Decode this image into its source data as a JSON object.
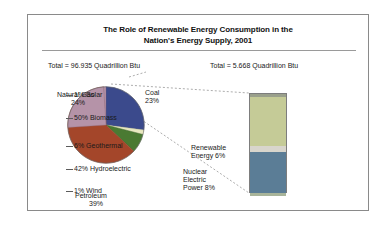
{
  "figure": {
    "title_line1": "The Role of Renewable Energy Consumption in the",
    "title_line2": "Nation's Energy Supply, 2001",
    "total_left": "Total = 96.935 Quadrillion Btu",
    "total_right": "Total = 5.668 Quadrillion Btu"
  },
  "chart_data": [
    {
      "type": "pie",
      "title": "Nation's Energy Supply, 2001",
      "total_label": "Total = 96.935 Quadrillion Btu",
      "total_value": 96.935,
      "units": "Quadrillion Btu",
      "categories": [
        "Coal",
        "Renewable Energy",
        "Nuclear Electric Power",
        "Petroleum",
        "Natural Gas"
      ],
      "values": [
        23,
        6,
        8,
        39,
        24
      ],
      "colors": [
        "#3b4a8c",
        "#e8e8c0",
        "#4a7a32",
        "#a4462a",
        "#b593a8"
      ],
      "labels": [
        {
          "name": "Coal",
          "pct": "23%",
          "value": 23
        },
        {
          "name": "Renewable Energy",
          "pct": "6%",
          "value": 6
        },
        {
          "name": "Nuclear Electric Power",
          "pct": "8%",
          "value": 8
        },
        {
          "name": "Petroleum",
          "pct": "39%",
          "value": 39
        },
        {
          "name": "Natural Gas",
          "pct": "24%",
          "value": 24
        }
      ],
      "label_text": {
        "natural_gas_name": "Natural Gas",
        "natural_gas_pct": "24%",
        "coal_name": "Coal",
        "coal_pct": "23%",
        "petroleum_name": "Petroleum",
        "petroleum_pct": "39%",
        "renewable_name": "Renewable",
        "renewable_pct": "Energy 6%",
        "nuclear_line1": "Nuclear",
        "nuclear_line2": "Electric",
        "nuclear_line3": "Power 8%"
      }
    },
    {
      "type": "bar",
      "subtype": "stacked-single-column",
      "title": "Renewable Energy Consumption, 2001",
      "total_label": "Total = 5.668 Quadrillion Btu",
      "total_value": 5.668,
      "units": "Quadrillion Btu",
      "categories": [
        "Solar",
        "Biomass",
        "Geothermal",
        "Hydroelectric",
        "Wind"
      ],
      "values": [
        1,
        50,
        6,
        42,
        1
      ],
      "colors": [
        "#9aa08c",
        "#c5cb97",
        "#d8d5cc",
        "#5b7d96",
        "#a8b49a"
      ],
      "ylim": [
        0,
        100
      ],
      "segments": [
        {
          "label": "1% Solar",
          "name": "Solar",
          "pct": 1,
          "color": "#9aa08c"
        },
        {
          "label": "50% Biomass",
          "name": "Biomass",
          "pct": 50,
          "color": "#c5cb97"
        },
        {
          "label": "6% Geothermal",
          "name": "Geothermal",
          "pct": 6,
          "color": "#d8d5cc"
        },
        {
          "label": "42% Hydroelectric",
          "name": "Hydroelectric",
          "pct": 42,
          "color": "#5b7d96"
        },
        {
          "label": "1% Wind",
          "name": "Wind",
          "pct": 1,
          "color": "#a8b49a"
        }
      ]
    }
  ]
}
